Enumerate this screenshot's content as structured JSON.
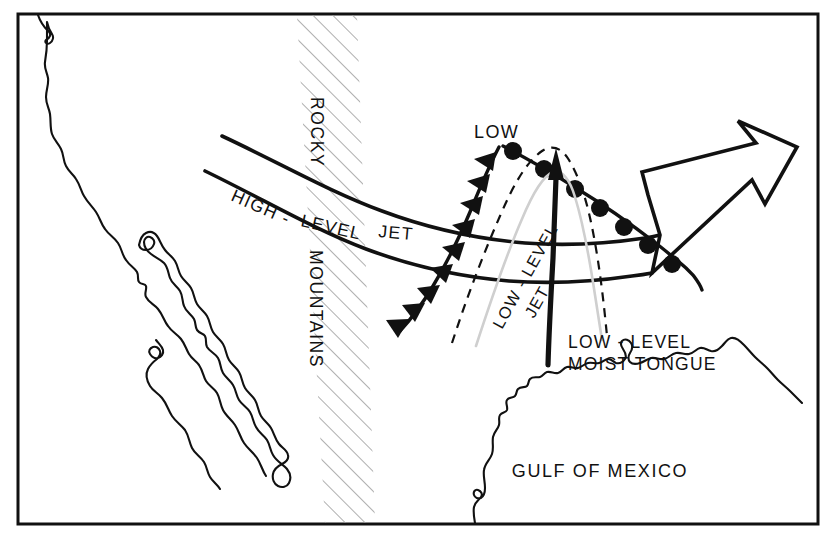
{
  "figure": {
    "kind": "weather-schematic-map",
    "title_visible": false,
    "background_color": "#ffffff",
    "ink_color": "#111111",
    "border": {
      "x": 18,
      "y": 14,
      "width": 800,
      "height": 510,
      "stroke_width": 3
    }
  },
  "labels": {
    "rocky_mountains_line1": "ROCKY",
    "rocky_mountains_line2": "MOUNTAINS",
    "high_level_jet_part1": "HIGH -",
    "high_level_jet_part2": "LEVEL",
    "high_level_jet_part3": "JET",
    "low_center": "LOW",
    "low_level_jet_part1": "LOW - LEVEL",
    "low_level_jet_part2": "JET",
    "moist_tongue_line1": "LOW - LEVEL",
    "moist_tongue_line2": "MOIST TONGUE",
    "gulf_of_mexico": "GULF OF MEXICO"
  },
  "features": {
    "rocky_mountains_band": {
      "name": "Rocky Mountains",
      "style": "diagonal-hatch",
      "hatch_angle_deg": 45,
      "hatch_color": "#9a9a9a"
    },
    "high_level_jet": {
      "name": "High-level jet",
      "style": "open-ribbon-with-hollow-arrowhead",
      "direction": "west-to-east"
    },
    "low_level_jet": {
      "name": "Low-level jet",
      "style": "thick-solid-line-with-solid-arrowhead",
      "direction": "south-to-north"
    },
    "cold_front": {
      "name": "Cold front",
      "style": "line-with-filled-triangles",
      "symbol": "triangle"
    },
    "warm_front": {
      "name": "Warm front",
      "style": "line-with-filled-semicircles",
      "symbol": "semicircle"
    },
    "moist_tongue": {
      "name": "Low-level moist tongue",
      "style": "dashed-outline",
      "dash_pattern": "9 7"
    },
    "coastlines": {
      "name": "Coastlines",
      "items": [
        "US West Coast",
        "Baja California",
        "Gulf of California",
        "Gulf of Mexico coast"
      ]
    }
  },
  "colors": {
    "ink": "#111111",
    "hatch": "#9a9a9a",
    "paper": "#ffffff"
  }
}
